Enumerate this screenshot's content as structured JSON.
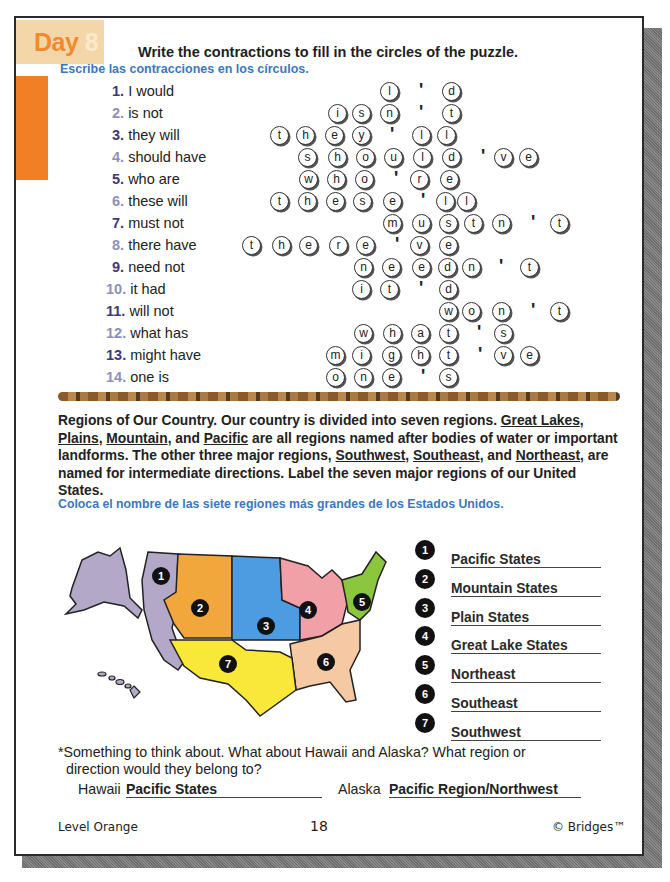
{
  "header": {
    "day_label": "Day",
    "day_number": "8",
    "title": "Write the contractions to fill in the circles of the puzzle.",
    "subtitle_es": "Escribe las contracciones en los círculos."
  },
  "puzzle": {
    "clues": [
      {
        "num": "1.",
        "text": "I would",
        "answer": "I'd"
      },
      {
        "num": "2.",
        "text": "is not",
        "answer": "isn't"
      },
      {
        "num": "3.",
        "text": "they will",
        "answer": "they'll"
      },
      {
        "num": "4.",
        "text": "should have",
        "answer": "should've"
      },
      {
        "num": "5.",
        "text": "who are",
        "answer": "who're"
      },
      {
        "num": "6.",
        "text": "these will",
        "answer": "these'll"
      },
      {
        "num": "7.",
        "text": "must not",
        "answer": "mustn't"
      },
      {
        "num": "8.",
        "text": "there have",
        "answer": "there've"
      },
      {
        "num": "9.",
        "text": "need not",
        "answer": "needn't"
      },
      {
        "num": "10.",
        "text": "it had",
        "answer": "it'd"
      },
      {
        "num": "11.",
        "text": "will not",
        "answer": "won't"
      },
      {
        "num": "12.",
        "text": "what has",
        "answer": "what's"
      },
      {
        "num": "13.",
        "text": "might have",
        "answer": "might've"
      },
      {
        "num": "14.",
        "text": "one is",
        "answer": "one's"
      }
    ],
    "rows": [
      [
        {
          "x": 390,
          "c": "l"
        },
        {
          "x": 422,
          "c": "'"
        },
        {
          "x": 452,
          "c": "d"
        }
      ],
      [
        {
          "x": 338,
          "c": "i"
        },
        {
          "x": 362,
          "c": "s"
        },
        {
          "x": 390,
          "c": "n"
        },
        {
          "x": 422,
          "c": "'"
        },
        {
          "x": 452,
          "c": "t"
        }
      ],
      [
        {
          "x": 280,
          "c": "t"
        },
        {
          "x": 306,
          "c": "h"
        },
        {
          "x": 335,
          "c": "e"
        },
        {
          "x": 362,
          "c": "y"
        },
        {
          "x": 393,
          "c": "'"
        },
        {
          "x": 422,
          "c": "l"
        },
        {
          "x": 447,
          "c": "l"
        }
      ],
      [
        {
          "x": 308,
          "c": "s"
        },
        {
          "x": 338,
          "c": "h"
        },
        {
          "x": 366,
          "c": "o"
        },
        {
          "x": 394,
          "c": "u"
        },
        {
          "x": 423,
          "c": "l"
        },
        {
          "x": 452,
          "c": "d"
        },
        {
          "x": 484,
          "c": "'"
        },
        {
          "x": 504,
          "c": "v"
        },
        {
          "x": 529,
          "c": "e"
        }
      ],
      [
        {
          "x": 309,
          "c": "w"
        },
        {
          "x": 337,
          "c": "h"
        },
        {
          "x": 365,
          "c": "o"
        },
        {
          "x": 397,
          "c": "'"
        },
        {
          "x": 420,
          "c": "r"
        },
        {
          "x": 450,
          "c": "e"
        }
      ],
      [
        {
          "x": 280,
          "c": "t"
        },
        {
          "x": 308,
          "c": "h"
        },
        {
          "x": 336,
          "c": "e"
        },
        {
          "x": 363,
          "c": "s"
        },
        {
          "x": 393,
          "c": "e"
        },
        {
          "x": 424,
          "c": "'"
        },
        {
          "x": 446,
          "c": "l"
        },
        {
          "x": 467,
          "c": "l"
        }
      ],
      [
        {
          "x": 393,
          "c": "m"
        },
        {
          "x": 422,
          "c": "u"
        },
        {
          "x": 449,
          "c": "s"
        },
        {
          "x": 474,
          "c": "t"
        },
        {
          "x": 502,
          "c": "n"
        },
        {
          "x": 534,
          "c": "'"
        },
        {
          "x": 560,
          "c": "t"
        }
      ],
      [
        {
          "x": 252,
          "c": "t"
        },
        {
          "x": 282,
          "c": "h"
        },
        {
          "x": 309,
          "c": "e"
        },
        {
          "x": 339,
          "c": "r"
        },
        {
          "x": 366,
          "c": "e"
        },
        {
          "x": 398,
          "c": "'"
        },
        {
          "x": 420,
          "c": "v"
        },
        {
          "x": 449,
          "c": "e"
        }
      ],
      [
        {
          "x": 364,
          "c": "n"
        },
        {
          "x": 392,
          "c": "e"
        },
        {
          "x": 422,
          "c": "e"
        },
        {
          "x": 448,
          "c": "d"
        },
        {
          "x": 472,
          "c": "n"
        },
        {
          "x": 502,
          "c": "'"
        },
        {
          "x": 530,
          "c": "t"
        }
      ],
      [
        {
          "x": 362,
          "c": "i"
        },
        {
          "x": 390,
          "c": "t"
        },
        {
          "x": 422,
          "c": "'"
        },
        {
          "x": 449,
          "c": "d"
        }
      ],
      [
        {
          "x": 449,
          "c": "w"
        },
        {
          "x": 472,
          "c": "o"
        },
        {
          "x": 502,
          "c": "n"
        },
        {
          "x": 534,
          "c": "'"
        },
        {
          "x": 560,
          "c": "t"
        }
      ],
      [
        {
          "x": 364,
          "c": "w"
        },
        {
          "x": 393,
          "c": "h"
        },
        {
          "x": 421,
          "c": "a"
        },
        {
          "x": 449,
          "c": "t"
        },
        {
          "x": 480,
          "c": "'"
        },
        {
          "x": 504,
          "c": "s"
        }
      ],
      [
        {
          "x": 336,
          "c": "m"
        },
        {
          "x": 362,
          "c": "i"
        },
        {
          "x": 392,
          "c": "g"
        },
        {
          "x": 421,
          "c": "h"
        },
        {
          "x": 449,
          "c": "t"
        },
        {
          "x": 481,
          "c": "'"
        },
        {
          "x": 504,
          "c": "v"
        },
        {
          "x": 530,
          "c": "e"
        }
      ],
      [
        {
          "x": 336,
          "c": "o"
        },
        {
          "x": 364,
          "c": "n"
        },
        {
          "x": 392,
          "c": "e"
        },
        {
          "x": 424,
          "c": "'"
        },
        {
          "x": 449,
          "c": "s"
        }
      ]
    ]
  },
  "regions_section": {
    "paragraph_parts": [
      {
        "t": "Regions of Our Country. Our country is divided into seven regions. "
      },
      {
        "t": "Great Lakes",
        "u": true
      },
      {
        "t": ", "
      },
      {
        "t": "Plains",
        "u": true
      },
      {
        "t": ", "
      },
      {
        "t": "Mountain",
        "u": true
      },
      {
        "t": ", and "
      },
      {
        "t": "Pacific",
        "u": true
      },
      {
        "t": " are all regions named after bodies of water or important landforms. The other three major regions, "
      },
      {
        "t": "Southwest",
        "u": true
      },
      {
        "t": ", "
      },
      {
        "t": "Southeast",
        "u": true
      },
      {
        "t": ", and "
      },
      {
        "t": "Northeast",
        "u": true
      },
      {
        "t": ", are named for intermediate directions. Label the seven major regions of our United States."
      }
    ],
    "instruction_es": "Coloca el nombre de las siete regiones más grandes de los Estados Unidos.",
    "map_colors": {
      "pacific": "#b3a8c8",
      "mountain": "#f2a73c",
      "plains": "#4d9be0",
      "great_lakes": "#f2a0a8",
      "northeast": "#8cc63f",
      "southeast": "#f5c9a3",
      "southwest": "#f9e83a"
    },
    "map_markers": [
      "1",
      "2",
      "3",
      "4",
      "5",
      "6",
      "7"
    ],
    "answers": [
      {
        "num": "1",
        "label": "Pacific States"
      },
      {
        "num": "2",
        "label": "Mountain States"
      },
      {
        "num": "3",
        "label": "Plain States"
      },
      {
        "num": "4",
        "label": "Great Lake States"
      },
      {
        "num": "5",
        "label": "Northeast"
      },
      {
        "num": "6",
        "label": "Southeast"
      },
      {
        "num": "7",
        "label": "Southwest"
      }
    ]
  },
  "think_about": {
    "line1": "*Something to think about. What about Hawaii and Alaska? What region or",
    "line2": "direction would they belong to?",
    "hawaii_label": "Hawaii",
    "hawaii_answer": "Pacific States",
    "alaska_label": "Alaska",
    "alaska_answer": "Pacific Region/Northwest"
  },
  "footer": {
    "level": "Level Orange",
    "page": "18",
    "brand": "© Bridges™"
  }
}
